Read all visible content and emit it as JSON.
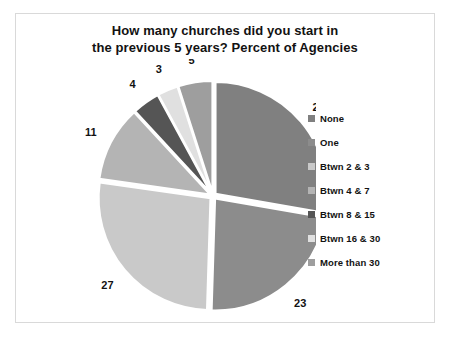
{
  "chart_data": {
    "type": "pie",
    "title": "How many churches did you start in the previous 5 years? Percent of Agencies",
    "title_lines": [
      "How many churches did you start in",
      "the previous 5 years? Percent of Agencies"
    ],
    "categories": [
      "None",
      "One",
      "Btwn 2 & 3",
      "Btwn 4 & 7",
      "Btwn 8 & 15",
      "Btwn 16 & 30",
      "More than 30"
    ],
    "values": [
      28,
      23,
      27,
      11,
      4,
      3,
      5
    ],
    "value_labels": [
      "28",
      "23",
      "27",
      "11",
      "4",
      "3",
      "5"
    ],
    "colors": [
      "#808080",
      "#8c8c8c",
      "#c9c9c9",
      "#b4b4b4",
      "#555555",
      "#e0e0e0",
      "#9e9e9e"
    ],
    "units": "percent",
    "legend_position": "right",
    "grid": false,
    "start_angle_deg": 0,
    "direction": "clockwise",
    "exploded": true
  },
  "legend": {
    "entries": [
      {
        "label": "None",
        "color": "#808080"
      },
      {
        "label": "One",
        "color": "#8c8c8c"
      },
      {
        "label": "Btwn 2 & 3",
        "color": "#c9c9c9"
      },
      {
        "label": "Btwn 4 & 7",
        "color": "#b4b4b4"
      },
      {
        "label": "Btwn 8 & 15",
        "color": "#555555"
      },
      {
        "label": "Btwn 16 & 30",
        "color": "#e0e0e0"
      },
      {
        "label": "More than 30",
        "color": "#9e9e9e"
      }
    ]
  }
}
